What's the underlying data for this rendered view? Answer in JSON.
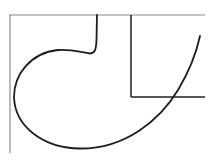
{
  "diagram": {
    "background": "#ffffff",
    "frame_color": "#8a8a8a",
    "shape_color": "#1e1e1e",
    "elements": [
      {
        "name": "top-boundary-line",
        "type": "line",
        "from": [
          9,
          15
        ],
        "to": [
          205,
          15
        ]
      },
      {
        "name": "left-boundary-line",
        "type": "line",
        "from": [
          10,
          15
        ],
        "to": [
          10,
          153
        ]
      },
      {
        "name": "inner-vertical-line",
        "type": "line",
        "from": [
          131,
          15
        ],
        "to": [
          131,
          97
        ]
      },
      {
        "name": "inner-horizontal-line",
        "type": "line",
        "from": [
          131,
          97
        ],
        "to": [
          205,
          97
        ]
      },
      {
        "name": "curve",
        "type": "path",
        "description": "hook-shaped curve from top at x=97 descending, looping left and down, then sweeping up to the right"
      }
    ]
  }
}
